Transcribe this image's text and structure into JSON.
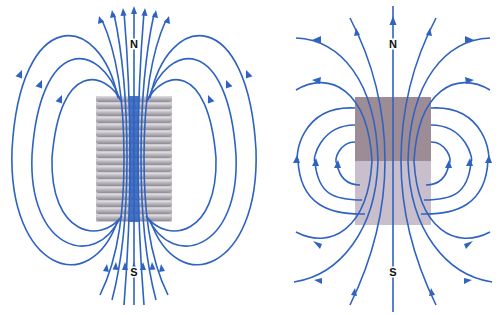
{
  "figure": {
    "panels": [
      {
        "id": "solenoid",
        "description": "Magnetic field lines of a current-carrying solenoid (coil)",
        "north_label": "N",
        "south_label": "S",
        "coil_color": "#b9b6bd",
        "field_line_color": "#2f63c2"
      },
      {
        "id": "bar-magnet",
        "description": "Magnetic field lines of a bar magnet",
        "north_label": "N",
        "south_label": "S",
        "north_half_color": "#9d8c95",
        "south_half_color": "#c9bfcc",
        "field_line_color": "#2f63c2"
      }
    ]
  }
}
